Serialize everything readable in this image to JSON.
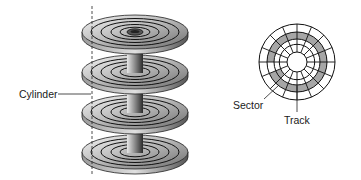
{
  "diagram": {
    "labels": {
      "cylinder": "Cylinder",
      "sector": "Sector",
      "track": "Track"
    },
    "platter_stack": {
      "platter_count": 4,
      "tracks_per_platter": 4,
      "cylinder_axis": "dashed vertical line"
    },
    "surface_view": {
      "concentric_tracks": 5,
      "radial_sector_lines": 16,
      "highlighted_track_index": 2,
      "highlighted_sector": "one wedge segment"
    },
    "colors": {
      "platter_light": "#d9d9d9",
      "platter_dark": "#6e6e6e",
      "track_lines": "#1a1a1a",
      "highlight": "#a6a6a6",
      "background": "#ffffff"
    }
  }
}
